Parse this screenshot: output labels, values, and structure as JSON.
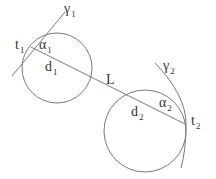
{
  "diagram": {
    "labels": {
      "gamma1": {
        "main": "γ",
        "sub": "1"
      },
      "gamma2": {
        "main": "γ",
        "sub": "2"
      },
      "t1": {
        "main": "t",
        "sub": "1"
      },
      "t2": {
        "main": "t",
        "sub": "2"
      },
      "alpha1": {
        "main": "α",
        "sub": "1"
      },
      "alpha2": {
        "main": "α",
        "sub": "2"
      },
      "d1": {
        "main": "d",
        "sub": "1"
      },
      "d2": {
        "main": "d",
        "sub": "2"
      },
      "L": "L"
    },
    "colors": {
      "stroke": "#7a7a7a",
      "text": "#333333"
    }
  }
}
